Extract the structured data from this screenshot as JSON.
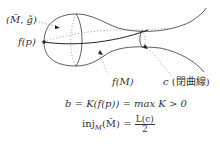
{
  "figure": {
    "labels": {
      "manifold": "(M̃, g̃)",
      "point": "f(p)",
      "image": "f(M)",
      "curve_name": "c",
      "curve_note": "(閉曲線)"
    },
    "equations": {
      "eq1_lhs": "b = K(f(p)) = max K > 0",
      "eq2_lhs": "inj",
      "eq2_sub": "M",
      "eq2_arg": "(M̃) =",
      "eq2_num": "L(c)",
      "eq2_den": "2"
    },
    "colors": {
      "stroke": "#333333",
      "dotted": "#888888"
    }
  }
}
